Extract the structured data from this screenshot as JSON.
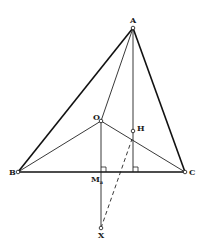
{
  "figure": {
    "type": "geometry-diagram",
    "points": {
      "A": {
        "label": "A",
        "x": 133,
        "y": 28
      },
      "B": {
        "label": "B",
        "x": 18,
        "y": 172
      },
      "C": {
        "label": "C",
        "x": 185,
        "y": 172
      },
      "O": {
        "label": "O",
        "x": 101,
        "y": 121
      },
      "H": {
        "label": "H",
        "x": 133,
        "y": 131
      },
      "Ma": {
        "label": "M",
        "sub": "a",
        "x": 101,
        "y": 172
      },
      "X": {
        "label": "X",
        "x": 101,
        "y": 228
      }
    },
    "segments": [
      {
        "from": "A",
        "to": "B",
        "style": "solid",
        "weight": "heavy"
      },
      {
        "from": "A",
        "to": "C",
        "style": "solid",
        "weight": "heavy"
      },
      {
        "from": "B",
        "to": "C",
        "style": "solid",
        "weight": "heavy"
      },
      {
        "from": "A",
        "to": "O",
        "style": "solid",
        "weight": "thin"
      },
      {
        "from": "O",
        "to": "B",
        "style": "solid",
        "weight": "thin"
      },
      {
        "from": "O",
        "to": "C",
        "style": "solid",
        "weight": "thin"
      },
      {
        "from": "O",
        "to": "X",
        "style": "solid",
        "weight": "thin"
      },
      {
        "from": "A",
        "to": "foot_A",
        "style": "solid",
        "weight": "thin"
      },
      {
        "from": "X",
        "to": "H_near",
        "style": "dashed",
        "weight": "thin"
      }
    ],
    "right_angles": [
      "M_a",
      "foot of altitude from A"
    ],
    "labels": {
      "A": "A",
      "B": "B",
      "C": "C",
      "O": "O",
      "H": "H",
      "M": "M",
      "M_sub": "a",
      "X": "X"
    }
  }
}
